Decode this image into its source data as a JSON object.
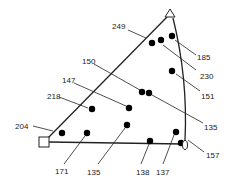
{
  "diagram": {
    "type": "ternary-triangle",
    "vertices": {
      "top": {
        "shape": "triangle",
        "x": 170,
        "y": 12
      },
      "left": {
        "shape": "square",
        "x": 44,
        "y": 142
      },
      "right": {
        "shape": "circle",
        "x": 185,
        "y": 145
      }
    },
    "line_color": "#222222",
    "point_color": "#000000",
    "points": [
      {
        "x": 152,
        "y": 43
      },
      {
        "x": 161,
        "y": 40
      },
      {
        "x": 172,
        "y": 36
      },
      {
        "x": 172,
        "y": 71
      },
      {
        "x": 142,
        "y": 92
      },
      {
        "x": 149,
        "y": 93
      },
      {
        "x": 92,
        "y": 109
      },
      {
        "x": 129,
        "y": 108
      },
      {
        "x": 62,
        "y": 133
      },
      {
        "x": 87,
        "y": 133
      },
      {
        "x": 127,
        "y": 125
      },
      {
        "x": 176,
        "y": 132
      },
      {
        "x": 150,
        "y": 141
      },
      {
        "x": 181,
        "y": 143
      }
    ],
    "labels": [
      {
        "text": "249",
        "x": 112,
        "y": 29,
        "lx1": 128,
        "ly1": 30,
        "lx2": 146,
        "ly2": 38
      },
      {
        "text": "185",
        "x": 197,
        "y": 60,
        "lx1": 196,
        "ly1": 55,
        "lx2": 175,
        "ly2": 40
      },
      {
        "text": "230",
        "x": 200,
        "y": 79,
        "lx1": 196,
        "ly1": 70,
        "lx2": 163,
        "ly2": 45
      },
      {
        "text": "150",
        "x": 82,
        "y": 64,
        "lx1": 94,
        "ly1": 64,
        "lx2": 140,
        "ly2": 90
      },
      {
        "text": "151",
        "x": 201,
        "y": 99,
        "lx1": 200,
        "ly1": 91,
        "lx2": 176,
        "ly2": 74
      },
      {
        "text": "147",
        "x": 62,
        "y": 83,
        "lx1": 74,
        "ly1": 83,
        "lx2": 126,
        "ly2": 106
      },
      {
        "text": "218",
        "x": 47,
        "y": 99,
        "lx1": 59,
        "ly1": 97,
        "lx2": 88,
        "ly2": 108
      },
      {
        "text": "135",
        "x": 204,
        "y": 130,
        "lx1": 203,
        "ly1": 123,
        "lx2": 152,
        "ly2": 95
      },
      {
        "text": "204",
        "x": 15,
        "y": 129,
        "lx1": 33,
        "ly1": 126,
        "lx2": 53,
        "ly2": 131
      },
      {
        "text": "157",
        "x": 206,
        "y": 158,
        "lx1": 204,
        "ly1": 152,
        "lx2": 188,
        "ly2": 140
      },
      {
        "text": "171",
        "x": 55,
        "y": 174,
        "lx1": 64,
        "ly1": 164,
        "lx2": 85,
        "ly2": 136
      },
      {
        "text": "135",
        "x": 87,
        "y": 175,
        "lx1": 98,
        "ly1": 164,
        "lx2": 125,
        "ly2": 128
      },
      {
        "text": "138",
        "x": 136,
        "y": 175,
        "lx1": 141,
        "ly1": 164,
        "lx2": 149,
        "ly2": 144
      },
      {
        "text": "137",
        "x": 156,
        "y": 175,
        "lx1": 163,
        "ly1": 164,
        "lx2": 174,
        "ly2": 135
      }
    ]
  }
}
